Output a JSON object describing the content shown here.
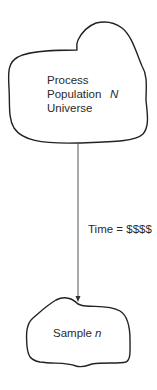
{
  "diagram": {
    "nodes": [
      {
        "id": "population",
        "shape": "cloud",
        "lines": [
          "Process",
          "Population",
          "Universe"
        ],
        "symbol": "N"
      },
      {
        "id": "sample",
        "shape": "cloud",
        "label": "Sample",
        "symbol": "n"
      }
    ],
    "edges": [
      {
        "from": "population",
        "to": "sample",
        "label": "Time = $$$$",
        "arrow": "end"
      }
    ]
  }
}
